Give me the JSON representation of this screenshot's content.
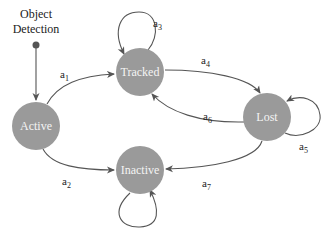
{
  "diagram": {
    "type": "state-machine",
    "colors": {
      "node_fill": "#9a9a9a",
      "node_text": "#f4f4f4",
      "edge": "#555555",
      "text": "#222222"
    },
    "start": {
      "label_line1": "Object",
      "label_line2": "Detection"
    },
    "nodes": [
      {
        "id": "active",
        "label": "Active"
      },
      {
        "id": "tracked",
        "label": "Tracked"
      },
      {
        "id": "lost",
        "label": "Lost"
      },
      {
        "id": "inactive",
        "label": "Inactive"
      }
    ],
    "edges": [
      {
        "id": "a1",
        "base": "a",
        "sub": "1",
        "from": "active",
        "to": "tracked"
      },
      {
        "id": "a2",
        "base": "a",
        "sub": "2",
        "from": "active",
        "to": "inactive"
      },
      {
        "id": "a3",
        "base": "a",
        "sub": "3",
        "from": "tracked",
        "to": "tracked"
      },
      {
        "id": "a4",
        "base": "a",
        "sub": "4",
        "from": "tracked",
        "to": "lost"
      },
      {
        "id": "a5",
        "base": "a",
        "sub": "5",
        "from": "lost",
        "to": "lost"
      },
      {
        "id": "a6",
        "base": "a",
        "sub": "6",
        "from": "lost",
        "to": "tracked"
      },
      {
        "id": "a7",
        "base": "a",
        "sub": "7",
        "from": "lost",
        "to": "inactive"
      },
      {
        "id": "inactive-loop",
        "from": "inactive",
        "to": "inactive"
      }
    ]
  }
}
